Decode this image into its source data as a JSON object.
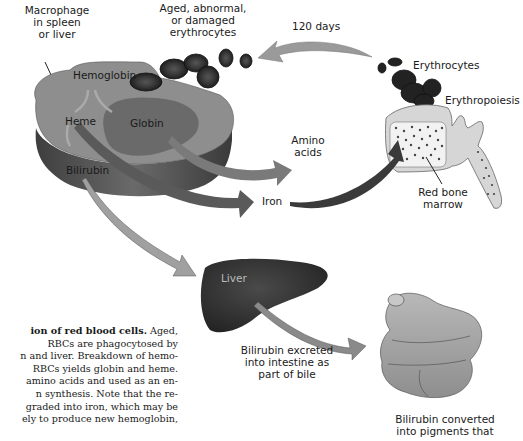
{
  "figure": {
    "labels": {
      "macrophage": [
        "Macrophage",
        "in spleen",
        "or liver"
      ],
      "aged_cells": [
        "Aged, abnormal,",
        "or damaged",
        "erythrocytes"
      ],
      "lifespan": "120 days",
      "erythrocytes": "Erythrocytes",
      "erythropoiesis": "Erythropoiesis",
      "hemoglobin": "Hemoglobin",
      "heme": "Heme",
      "globin": "Globin",
      "bilirubin": "Bilirubin",
      "amino_acids": [
        "Amino",
        "acids"
      ],
      "iron": "Iron",
      "red_bone_marrow": [
        "Red bone",
        "marrow"
      ],
      "liver": "Liver",
      "bile": [
        "Bilirubin excreted",
        "into intestine as",
        "part of bile"
      ],
      "intestine": [
        "Bilirubin converted",
        "into pigments that"
      ]
    },
    "colors": {
      "macrophage_top": "#8e8e8e",
      "macrophage_side": "#5e5e5e",
      "globin_region": "#6a6a6a",
      "rbc": "#2b2b2b",
      "arrow_light": "#9a9a9a",
      "arrow_dark": "#4a4a4a",
      "bone": "#d6d6d6",
      "liver": "#3a3a3a",
      "intestine": "#a8a8a8"
    }
  },
  "caption": {
    "bold_lead": "ion of red blood cells.",
    "lines": [
      " Aged,",
      "RBCs are phagocytosed by",
      "n and liver. Breakdown of hemo-",
      "RBCs yields globin and heme.",
      "amino acids and used as an en-",
      "n synthesis. Note that the re-",
      "graded into iron, which may be",
      "ely to produce new hemoglobin,"
    ]
  }
}
